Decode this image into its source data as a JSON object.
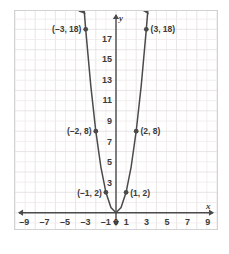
{
  "figure": {
    "kind": "coordinate-plane-graph",
    "background_color": "#ffffff",
    "frame_border_color": "#d2d2d2",
    "grid_color": "#e3dede",
    "grid_minor_color": "#efe9e9",
    "axis_color": "#4a4a4a",
    "curve_color": "#4a4a4a",
    "text_color": "#3b3b3b"
  },
  "chart_data": {
    "type": "line",
    "title": "",
    "subtitle": "",
    "xlabel": "x",
    "ylabel": "y",
    "xlim": [
      -10,
      10
    ],
    "ylim": [
      -1.6,
      19.8
    ],
    "grid": true,
    "grid_step": 1,
    "legend": "none",
    "series": [
      {
        "name": "y = 2x^2",
        "equation_form": "y = 2x * x",
        "color": "#4a4a4a",
        "arrows": [
          "start",
          "end"
        ],
        "x": [
          -3.15,
          -3,
          -2.5,
          -2,
          -1.5,
          -1,
          -0.5,
          0,
          0.5,
          1,
          1.5,
          2,
          2.5,
          3,
          3.15
        ],
        "y": [
          19.8,
          18,
          12.5,
          8,
          4.5,
          2,
          0.5,
          0,
          0.5,
          2,
          4.5,
          8,
          12.5,
          18,
          19.8
        ]
      }
    ],
    "plotted_points": [
      {
        "id": "p-neg3",
        "x": -3,
        "y": 18,
        "label": "(–3, 18)",
        "label_side": "left"
      },
      {
        "id": "p-pos3",
        "x": 3,
        "y": 18,
        "label": "(3, 18)",
        "label_side": "right"
      },
      {
        "id": "p-neg2",
        "x": -2,
        "y": 8,
        "label": "(–2, 8)",
        "label_side": "left"
      },
      {
        "id": "p-pos2",
        "x": 2,
        "y": 8,
        "label": "(2, 8)",
        "label_side": "right"
      },
      {
        "id": "p-neg1",
        "x": -1,
        "y": 2,
        "label": "(–1, 2)",
        "label_side": "left"
      },
      {
        "id": "p-pos1",
        "x": 1,
        "y": 2,
        "label": "(1, 2)",
        "label_side": "right"
      }
    ],
    "x_ticks": [
      {
        "value": -9,
        "label": "–9"
      },
      {
        "value": -7,
        "label": "–7"
      },
      {
        "value": -5,
        "label": "–5"
      },
      {
        "value": -3,
        "label": "–3"
      },
      {
        "value": -1,
        "label": "–1"
      },
      {
        "value": 0,
        "label": "0"
      },
      {
        "value": 1,
        "label": "1"
      },
      {
        "value": 3,
        "label": "3"
      },
      {
        "value": 5,
        "label": "5"
      },
      {
        "value": 7,
        "label": "7"
      },
      {
        "value": 9,
        "label": "9"
      }
    ],
    "y_ticks": [
      {
        "value": 3,
        "label": "3"
      },
      {
        "value": 5,
        "label": "5"
      },
      {
        "value": 7,
        "label": "7"
      },
      {
        "value": 9,
        "label": "9"
      },
      {
        "value": 11,
        "label": "11"
      },
      {
        "value": 13,
        "label": "13"
      },
      {
        "value": 15,
        "label": "15"
      },
      {
        "value": 17,
        "label": "17"
      }
    ],
    "axis_labels": {
      "x_axis_name": "x",
      "y_axis_name": "y"
    }
  }
}
